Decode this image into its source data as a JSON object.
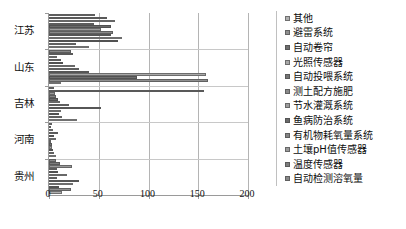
{
  "chart_data": {
    "type": "bar",
    "orientation": "horizontal",
    "title": "",
    "xlabel": "",
    "ylabel": "",
    "xlim": [
      0,
      200
    ],
    "xticks": [
      0,
      50,
      100,
      150,
      200
    ],
    "xtick_labels": [
      "0",
      "50",
      "100",
      "150",
      "200"
    ],
    "grid": true,
    "grid_axis": "x",
    "legend_position": "right",
    "categories": [
      "江苏",
      "山东",
      "吉林",
      "河南",
      "贵州"
    ],
    "series": [
      {
        "name": "其他",
        "color": "#b0b0b0",
        "values": [
          40,
          12,
          28,
          7,
          13
        ]
      },
      {
        "name": "避雷系统",
        "color": "#8f8f8f",
        "values": [
          27,
          160,
          13,
          5,
          22
        ]
      },
      {
        "name": "自动卷帘",
        "color": "#6e6e6e",
        "values": [
          69,
          88,
          10,
          4,
          10
        ]
      },
      {
        "name": "光照传感器",
        "color": "#a8a8a8",
        "values": [
          73,
          158,
          12,
          3,
          24
        ]
      },
      {
        "name": "自动投喂系统",
        "color": "#757575",
        "values": [
          62,
          40,
          52,
          3,
          30
        ]
      },
      {
        "name": "测土配方施肥",
        "color": "#8a8a8a",
        "values": [
          64,
          30,
          20,
          2,
          8
        ]
      },
      {
        "name": "节水灌溉系统",
        "color": "#9d9d9d",
        "values": [
          52,
          26,
          11,
          7,
          18
        ]
      },
      {
        "name": "鱼病防治系统",
        "color": "#6a6a6a",
        "values": [
          62,
          14,
          9,
          5,
          9
        ]
      },
      {
        "name": "有机物耗氧量系统",
        "color": "#848484",
        "values": [
          45,
          12,
          7,
          9,
          8
        ]
      },
      {
        "name": "土壤pH值传感器",
        "color": "#9a9a9a",
        "values": [
          66,
          8,
          6,
          4,
          23
        ]
      },
      {
        "name": "温度传感器",
        "color": "#7c7c7c",
        "values": [
          58,
          24,
          156,
          2,
          11
        ]
      },
      {
        "name": "自动检测溶氧量",
        "color": "#888888",
        "values": [
          46,
          22,
          5,
          3,
          7
        ]
      }
    ]
  }
}
